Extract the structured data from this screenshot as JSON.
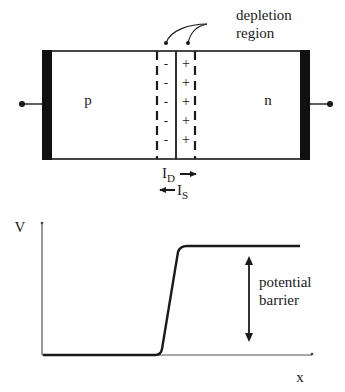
{
  "diagram": {
    "junction": {
      "p_label": "p",
      "n_label": "n",
      "depletion_label_line1": "depletion",
      "depletion_label_line2": "region",
      "minus_signs": [
        "-",
        "-",
        "-",
        "-",
        "-"
      ],
      "plus_signs": [
        "+",
        "+",
        "+",
        "+",
        "+"
      ],
      "drift_current": {
        "symbol": "I",
        "subscript": "D",
        "direction": "right"
      },
      "diffusion_current": {
        "symbol": "I",
        "subscript": "S",
        "direction": "left"
      }
    },
    "plot": {
      "y_axis_label": "V",
      "x_axis_label": "x",
      "barrier_label_line1": "potential",
      "barrier_label_line2": "barrier"
    },
    "colors": {
      "line": "#1a1a1a",
      "contact": "#111111",
      "background": "#ffffff"
    }
  }
}
